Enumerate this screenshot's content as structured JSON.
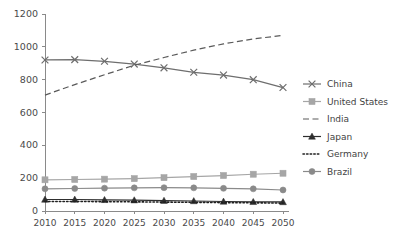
{
  "chart_data": {
    "type": "line",
    "title": "",
    "xlabel": "",
    "ylabel": "",
    "categories": [
      "2010",
      "2015",
      "2020",
      "2025",
      "2030",
      "2035",
      "2040",
      "2045",
      "2050"
    ],
    "x": [
      2010,
      2015,
      2020,
      2025,
      2030,
      2035,
      2040,
      2045,
      2050
    ],
    "ylim": [
      0,
      1200
    ],
    "yticks": [
      0,
      200,
      400,
      600,
      800,
      1000,
      1200
    ],
    "ytick_labels": [
      "0",
      "200",
      "400",
      "600",
      "800",
      "1000",
      "1200"
    ],
    "grid": false,
    "legend_position": "right",
    "series": [
      {
        "name": "China",
        "marker": "x",
        "linestyle": "solid",
        "color": "#6e6e6e",
        "values": [
          920,
          922,
          912,
          895,
          872,
          845,
          828,
          800,
          752
        ]
      },
      {
        "name": "United States",
        "marker": "square",
        "linestyle": "solid",
        "color": "#a6a6a6",
        "values": [
          190,
          192,
          194,
          197,
          203,
          210,
          216,
          224,
          230
        ]
      },
      {
        "name": "India",
        "marker": "none",
        "linestyle": "dashed",
        "color": "#5a5a5a",
        "values": [
          706,
          770,
          830,
          888,
          935,
          980,
          1018,
          1048,
          1070
        ]
      },
      {
        "name": "Japan",
        "marker": "triangle",
        "linestyle": "solid",
        "color": "#2e2e2e",
        "values": [
          70,
          70,
          68,
          66,
          63,
          61,
          58,
          56,
          55
        ]
      },
      {
        "name": "Germany",
        "marker": "none",
        "linestyle": "dotted",
        "color": "#1f1f1f",
        "values": [
          58,
          58,
          57,
          56,
          54,
          53,
          51,
          50,
          48
        ]
      },
      {
        "name": "Brazil",
        "marker": "circle",
        "linestyle": "solid",
        "color": "#8a8a8a",
        "values": [
          135,
          137,
          139,
          141,
          142,
          141,
          138,
          135,
          128
        ]
      }
    ]
  },
  "legend": {
    "items": [
      {
        "label": "China"
      },
      {
        "label": "United States"
      },
      {
        "label": "India"
      },
      {
        "label": "Japan"
      },
      {
        "label": "Germany"
      },
      {
        "label": "Brazil"
      }
    ]
  }
}
